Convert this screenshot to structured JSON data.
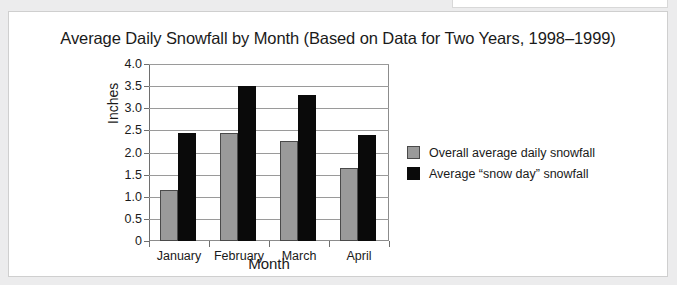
{
  "chart_data": {
    "type": "bar",
    "title": "Average Daily Snowfall by Month (Based on Data for Two Years, 1998–1999)",
    "xlabel": "Month",
    "ylabel": "Inches",
    "categories": [
      "January",
      "February",
      "March",
      "April"
    ],
    "series": [
      {
        "name": "Overall average daily snowfall",
        "color": "#9a9a9a",
        "values": [
          1.15,
          2.43,
          2.25,
          1.65
        ]
      },
      {
        "name": "Average “snow day” snowfall",
        "color": "#0a0a0a",
        "values": [
          2.45,
          3.5,
          3.3,
          2.4
        ]
      }
    ],
    "ylim": [
      0,
      4.0
    ],
    "yticks": [
      "0",
      "0.5",
      "1.0",
      "1.5",
      "2.0",
      "2.5",
      "3.0",
      "3.5",
      "4.0"
    ],
    "ytick_values": [
      0,
      0.5,
      1.0,
      1.5,
      2.0,
      2.5,
      3.0,
      3.5,
      4.0
    ],
    "grid": true,
    "legend_position": "right"
  }
}
